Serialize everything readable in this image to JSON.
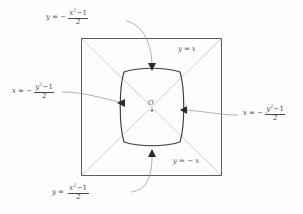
{
  "figure": {
    "origin_label": "O",
    "square": {
      "x": 81,
      "y": 38,
      "width": 141,
      "height": 138
    },
    "diagonals": [
      {
        "name": "y = x",
        "label": "y = x"
      },
      {
        "name": "y = -x",
        "label": "y = −x"
      }
    ],
    "diagonal_labels": [
      {
        "id": "y-equals-x",
        "lhs": "y",
        "op": "=",
        "rhs": "x",
        "neg": false
      },
      {
        "id": "y-equals-minus-x",
        "lhs": "y",
        "op": "=",
        "rhs": "x",
        "neg": true
      }
    ],
    "curve_labels": [
      {
        "id": "top-curve",
        "position": "top",
        "lhs": "y",
        "eq": "=",
        "sign": "−",
        "numerator_var": "x",
        "numerator_exp": "2",
        "numerator_tail": "−1",
        "denominator": "2",
        "plain": "y = -(x^2-1)/2"
      },
      {
        "id": "left-curve",
        "position": "left",
        "lhs": "x",
        "eq": "=",
        "sign": "−",
        "numerator_var": "y",
        "numerator_exp": "2",
        "numerator_tail": "−1",
        "denominator": "2",
        "plain": "x = -(y^2-1)/2"
      },
      {
        "id": "right-curve",
        "position": "right",
        "lhs": "x",
        "eq": "=",
        "sign": "−",
        "numerator_var": "y",
        "numerator_exp": "2",
        "numerator_tail": "−1",
        "denominator": "2",
        "plain": "x = -(y^2-1)/2"
      },
      {
        "id": "bottom-curve",
        "position": "bottom",
        "lhs": "y",
        "eq": "=",
        "sign": "",
        "numerator_var": "x",
        "numerator_exp": "2",
        "numerator_tail": "−1",
        "denominator": "2",
        "plain": "y = (x^2-1)/2"
      }
    ],
    "colors": {
      "square_stroke": "#5a5a5a",
      "diagonal_stroke": "#bcbcbc",
      "curve_stroke": "#3c3c3c",
      "leader_stroke": "#8e8e8e",
      "arrow_fill": "#2b2b2b",
      "text": "#4a4a4a",
      "background": "#fdfdfd"
    }
  }
}
